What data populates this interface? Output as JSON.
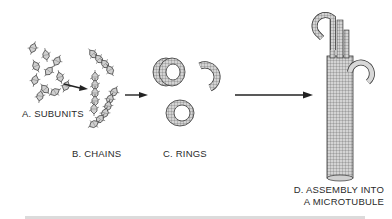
{
  "figure": {
    "stages": [
      {
        "id": "A",
        "label": "A. SUBUNITS"
      },
      {
        "id": "B",
        "label": "B. CHAINS"
      },
      {
        "id": "C",
        "label": "C. RINGS"
      },
      {
        "id": "D",
        "label_line1": "D. ASSEMBLY INTO",
        "label_line2": "A MICROTUBULE"
      }
    ],
    "arrows": [
      {
        "from": "A",
        "to": "B"
      },
      {
        "from": "B",
        "to": "C"
      },
      {
        "from": "C",
        "to": "D"
      }
    ],
    "colors": {
      "ink": "#2a2a2a",
      "shade": "#9a9a9a",
      "light": "#d8d8d8",
      "background": "#ffffff"
    }
  }
}
